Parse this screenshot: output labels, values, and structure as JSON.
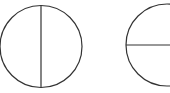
{
  "diagram": {
    "stroke_color": "#333333",
    "background": "#ffffff",
    "shapes": [
      {
        "name": "circle-vertical-diameter",
        "cx": 41,
        "cy": 46.5,
        "r": 41,
        "line": "vertical"
      },
      {
        "name": "circle-horizontal-radius",
        "cx": 167,
        "cy": 45,
        "r": 41,
        "line": "horizontal"
      }
    ]
  }
}
